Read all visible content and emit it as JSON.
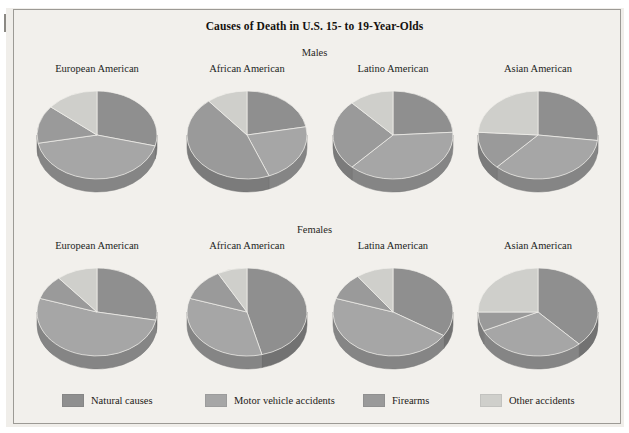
{
  "figure": {
    "title": "Causes of Death in U.S. 15- to 19-Year-Olds",
    "sections": [
      {
        "label": "Males"
      },
      {
        "label": "Females"
      }
    ]
  },
  "legend": {
    "items": [
      {
        "label": "Natural causes",
        "color": "#8f8f8f"
      },
      {
        "label": "Motor vehicle accidents",
        "color": "#a6a6a6"
      },
      {
        "label": "Firearms",
        "color": "#9a9a9a"
      },
      {
        "label": "Other accidents",
        "color": "#cfcfcb"
      }
    ]
  },
  "chart_data": {
    "type": "pie",
    "title": "Causes of Death in U.S. 15- to 19-Year-Olds",
    "categories": [
      "Natural causes",
      "Motor vehicle accidents",
      "Firearms",
      "Other accidents"
    ],
    "colors": [
      "#8f8f8f",
      "#a6a6a6",
      "#9a9a9a",
      "#cfcfcb"
    ],
    "legend_position": "bottom",
    "units": "percent",
    "panels": [
      {
        "section": "Males",
        "label": "European American",
        "values": [
          29,
          43,
          14,
          14
        ]
      },
      {
        "section": "Males",
        "label": "African American",
        "values": [
          22,
          22,
          45,
          11
        ]
      },
      {
        "section": "Males",
        "label": "Latino American",
        "values": [
          24,
          38,
          26,
          12
        ]
      },
      {
        "section": "Males",
        "label": "Asian American",
        "values": [
          27,
          35,
          14,
          24
        ]
      },
      {
        "section": "Females",
        "label": "European American",
        "values": [
          28,
          52,
          9,
          11
        ]
      },
      {
        "section": "Females",
        "label": "African American",
        "values": [
          46,
          34,
          12,
          8
        ]
      },
      {
        "section": "Females",
        "label": "Latina American",
        "values": [
          34,
          46,
          10,
          10
        ]
      },
      {
        "section": "Females",
        "label": "Asian American",
        "values": [
          38,
          30,
          7,
          25
        ]
      }
    ]
  }
}
